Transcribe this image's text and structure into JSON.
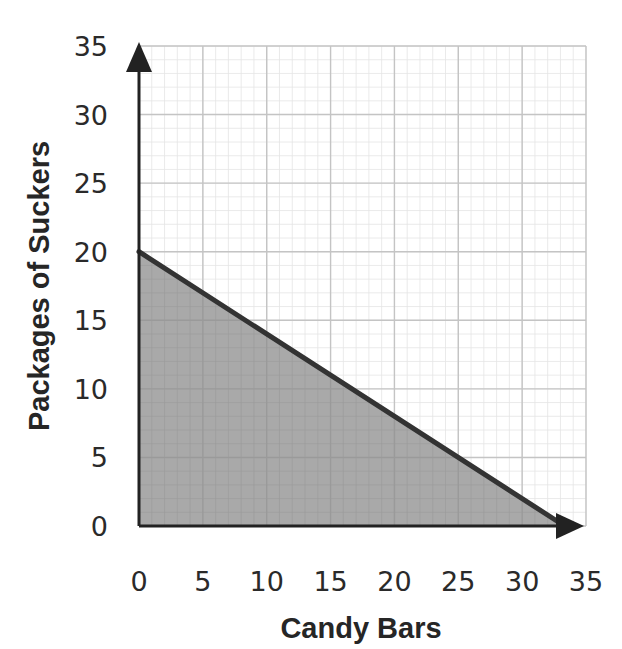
{
  "chart_data": {
    "type": "area",
    "title": "",
    "xlabel": "Candy Bars",
    "ylabel": "Packages of Suckers",
    "xlim": [
      0,
      35
    ],
    "ylim": [
      0,
      35
    ],
    "x_ticks": [
      "0",
      "5",
      "10",
      "15",
      "20",
      "25",
      "30",
      "35"
    ],
    "y_ticks": [
      "0",
      "5",
      "10",
      "15",
      "20",
      "25",
      "30",
      "35"
    ],
    "grid": true,
    "legend": null,
    "series": [
      {
        "name": "boundary line",
        "type": "line",
        "points": [
          [
            0,
            20
          ],
          [
            33.33,
            0
          ]
        ],
        "equation": "y = 20 - 0.6x",
        "color": "#333333"
      },
      {
        "name": "feasible region",
        "type": "area",
        "polygon": [
          [
            0,
            0
          ],
          [
            0,
            20
          ],
          [
            33.33,
            0
          ]
        ],
        "fill": "#a9a9a9"
      }
    ],
    "annotations": []
  },
  "colors": {
    "axis": "#222222",
    "line": "#333333",
    "shade": "#a9a9a9",
    "grid_major": "#c4c4c4",
    "grid_minor": "#e4e4e4"
  }
}
